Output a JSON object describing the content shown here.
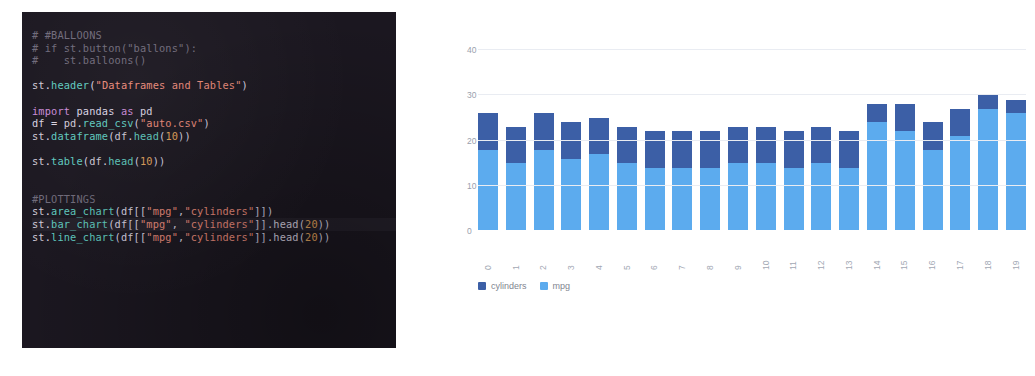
{
  "code_editor": {
    "name": "streamlit-script-code",
    "background_color": "#1b1720",
    "lines": [
      {
        "text": "# #BALLOONS",
        "kind": "comment"
      },
      {
        "text": "# if st.button(\"ballons\"):",
        "kind": "comment"
      },
      {
        "text": "#    st.balloons()",
        "kind": "comment"
      },
      {
        "text": "",
        "kind": "blank"
      },
      {
        "text": "st.header(\"Dataframes and Tables\")",
        "kind": "code"
      },
      {
        "text": "",
        "kind": "blank"
      },
      {
        "text": "import pandas as pd",
        "kind": "code"
      },
      {
        "text": "df = pd.read_csv(\"auto.csv\")",
        "kind": "code"
      },
      {
        "text": "st.dataframe(df.head(10))",
        "kind": "code"
      },
      {
        "text": "",
        "kind": "blank"
      },
      {
        "text": "st.table(df.head(10))",
        "kind": "code"
      },
      {
        "text": "",
        "kind": "blank"
      },
      {
        "text": "",
        "kind": "blank"
      },
      {
        "text": "#PLOTTINGS",
        "kind": "comment"
      },
      {
        "text": "st.area_chart(df[[\"mpg\",\"cylinders\"]])",
        "kind": "code"
      },
      {
        "text": "st.bar_chart(df[[\"mpg\", \"cylinders\"]].head(20))",
        "kind": "code"
      },
      {
        "text": "st.line_chart(df[[\"mpg\",\"cylinders\"]].head(20))",
        "kind": "code"
      }
    ]
  },
  "chart_data": {
    "type": "bar",
    "stacked": true,
    "title": "",
    "xlabel": "",
    "ylabel": "",
    "ylim": [
      0,
      40
    ],
    "yticks": [
      0,
      10,
      20,
      30,
      40
    ],
    "grid": true,
    "legend_position": "bottom-left",
    "categories": [
      "0",
      "1",
      "2",
      "3",
      "4",
      "5",
      "6",
      "7",
      "8",
      "9",
      "10",
      "11",
      "12",
      "13",
      "14",
      "15",
      "16",
      "17",
      "18",
      "19"
    ],
    "series": [
      {
        "name": "mpg",
        "color": "#5cabee",
        "values": [
          18,
          15,
          18,
          16,
          17,
          15,
          14,
          14,
          14,
          15,
          15,
          14,
          15,
          14,
          24,
          22,
          18,
          21,
          27,
          26
        ]
      },
      {
        "name": "cylinders",
        "color": "#3c5fa6",
        "values": [
          8,
          8,
          8,
          8,
          8,
          8,
          8,
          8,
          8,
          8,
          8,
          8,
          8,
          8,
          4,
          6,
          6,
          6,
          3,
          3
        ]
      }
    ],
    "totals": [
      26,
      23,
      26,
      24,
      25,
      23,
      22,
      22,
      22,
      23,
      23,
      22,
      23,
      22,
      28,
      28,
      24,
      27,
      30,
      29
    ]
  }
}
